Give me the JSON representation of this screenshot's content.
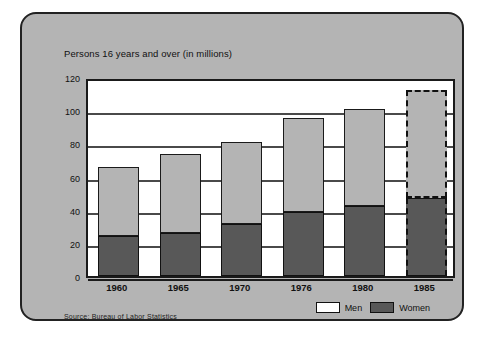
{
  "card": {
    "title": "Persons 16 years and over (in millions)",
    "source": "Source: Bureau of Labor Statistics"
  },
  "legend": {
    "men_label": "Men",
    "women_label": "Women"
  },
  "colors": {
    "card_background": "#b4b4b4",
    "plot_background": "#ffffff",
    "men_fill": "#b4b4b4",
    "women_fill": "#585858",
    "outline": "#1a1a1a",
    "gridline": "#4a4a4a"
  },
  "chart_data": {
    "type": "bar",
    "stacked": true,
    "title": "Persons 16 years and over (in millions)",
    "xlabel": "",
    "ylabel": "",
    "ylim": [
      0,
      120
    ],
    "yticks": [
      0,
      20,
      40,
      60,
      80,
      100,
      120
    ],
    "ytick_labels": [
      "0",
      "20",
      "40",
      "60",
      "80",
      "100",
      "120"
    ],
    "grid": true,
    "legend_position": "bottom-right",
    "categories": [
      "1960",
      "1965",
      "1970",
      "1976",
      "1980",
      "1985"
    ],
    "series": [
      {
        "name": "Women",
        "values": [
          24,
          26,
          31.5,
          38.5,
          42.5,
          47
        ]
      },
      {
        "name": "Men",
        "values": [
          42,
          47.5,
          49.5,
          56.5,
          58.5,
          65
        ]
      }
    ],
    "totals": [
      66,
      73.5,
      81,
      95,
      101,
      112
    ],
    "annotations": [
      {
        "category": "1985",
        "note": "projected (dashed outline)"
      }
    ],
    "source": "Source: Bureau of Labor Statistics"
  }
}
